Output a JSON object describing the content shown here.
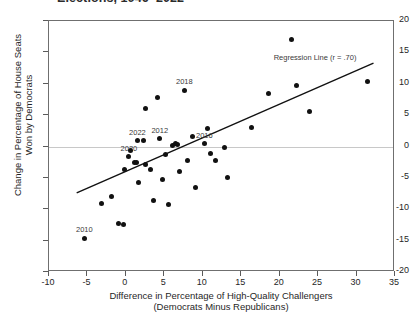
{
  "chart_data": {
    "type": "scatter",
    "title": "Elections, 1946–2022",
    "xlabel_line1": "Difference in Percentage of High-Quality Challengers",
    "xlabel_line2": "(Democrats Minus Republicans)",
    "ylabel_line1": "Change in Percentage of House Seats",
    "ylabel_line2": "Won by Democrats",
    "xlim": [
      -10,
      35
    ],
    "ylim": [
      -20,
      20
    ],
    "xticks": [
      -10,
      -5,
      0,
      5,
      10,
      15,
      20,
      25,
      30,
      35
    ],
    "yticks": [
      -20,
      -15,
      -10,
      -5,
      0,
      5,
      10,
      15,
      20
    ],
    "grid": false,
    "legend": "none",
    "zero_reference_line": 0,
    "annotations": [
      {
        "name": "regression-annotation",
        "text": "Regression Line (r = .70)",
        "x": 24.6,
        "y": 14.2
      }
    ],
    "regression_line": {
      "x_start": -6.4,
      "y_start": -7.4,
      "x_end": 32.2,
      "y_end": 13.3,
      "r": 0.7
    },
    "point_color": "#111111",
    "line_color": "#111111",
    "axis_color": "#6f6f6f",
    "points": [
      {
        "x": -5.4,
        "y": -14.6,
        "label": "2010"
      },
      {
        "x": -3.2,
        "y": -9.1,
        "label": null
      },
      {
        "x": -1.9,
        "y": -8.0,
        "label": null
      },
      {
        "x": -1.0,
        "y": -12.3,
        "label": null
      },
      {
        "x": -0.3,
        "y": -12.5,
        "label": null
      },
      {
        "x": -0.2,
        "y": -3.6,
        "label": null
      },
      {
        "x": 0.4,
        "y": -1.6,
        "label": "2020"
      },
      {
        "x": 0.6,
        "y": -0.7,
        "label": null
      },
      {
        "x": 1.1,
        "y": -2.6,
        "label": null
      },
      {
        "x": 1.4,
        "y": -2.6,
        "label": null
      },
      {
        "x": 1.5,
        "y": 0.9,
        "label": "2022"
      },
      {
        "x": 1.6,
        "y": -5.7,
        "label": null
      },
      {
        "x": 2.3,
        "y": 1.0,
        "label": null
      },
      {
        "x": 2.5,
        "y": -2.8,
        "label": null
      },
      {
        "x": 2.6,
        "y": 6.0,
        "label": null
      },
      {
        "x": 3.2,
        "y": -3.6,
        "label": null
      },
      {
        "x": 3.6,
        "y": -8.6,
        "label": null
      },
      {
        "x": 4.1,
        "y": 7.8,
        "label": null
      },
      {
        "x": 4.4,
        "y": 1.2,
        "label": "2012"
      },
      {
        "x": 4.8,
        "y": -5.2,
        "label": null
      },
      {
        "x": 5.1,
        "y": -1.3,
        "label": null
      },
      {
        "x": 5.5,
        "y": -9.3,
        "label": null
      },
      {
        "x": 6.0,
        "y": 0.2,
        "label": null
      },
      {
        "x": 6.4,
        "y": 0.4,
        "label": null
      },
      {
        "x": 6.7,
        "y": 0.3,
        "label": null
      },
      {
        "x": 7.0,
        "y": -4.0,
        "label": null
      },
      {
        "x": 7.6,
        "y": 9.0,
        "label": "2018"
      },
      {
        "x": 8.0,
        "y": -2.2,
        "label": null
      },
      {
        "x": 8.6,
        "y": 1.6,
        "label": null
      },
      {
        "x": 9.1,
        "y": -6.5,
        "label": null
      },
      {
        "x": 10.2,
        "y": 0.4,
        "label": "2016"
      },
      {
        "x": 10.6,
        "y": 2.8,
        "label": null
      },
      {
        "x": 11.0,
        "y": -1.1,
        "label": null
      },
      {
        "x": 11.6,
        "y": -2.2,
        "label": null
      },
      {
        "x": 12.8,
        "y": -0.2,
        "label": null
      },
      {
        "x": 13.2,
        "y": -4.9,
        "label": null
      },
      {
        "x": 16.4,
        "y": 3.1,
        "label": null
      },
      {
        "x": 18.6,
        "y": 8.4,
        "label": null
      },
      {
        "x": 21.6,
        "y": 17.0,
        "label": null
      },
      {
        "x": 22.2,
        "y": 9.8,
        "label": null
      },
      {
        "x": 23.9,
        "y": 5.6,
        "label": null
      },
      {
        "x": 31.4,
        "y": 10.4,
        "label": null
      }
    ]
  }
}
